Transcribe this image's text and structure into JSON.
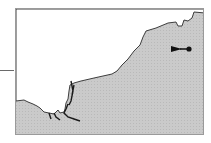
{
  "map": {
    "style": "grayscale coastline inset map",
    "colors": {
      "land": "#ffffff",
      "sea": "#c8c8c8",
      "coastline": "#2a2a2a",
      "frame": "#9a9a9a",
      "marker": "#111111"
    },
    "markers": [
      {
        "type": "arrow-to-point",
        "x": 173,
        "y": 40
      }
    ],
    "leader_line": {
      "side": "left"
    }
  }
}
